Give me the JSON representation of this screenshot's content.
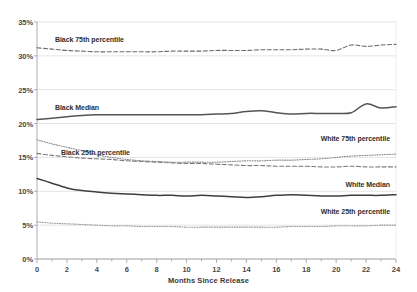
{
  "chart_data": {
    "type": "line",
    "title": "",
    "xlabel": "Months Since Release",
    "ylabel": "",
    "xlim": [
      0,
      24
    ],
    "ylim": [
      0,
      35
    ],
    "grid": true,
    "legend_position": "inline-labels",
    "x_tick_labels": [
      "0",
      "2",
      "4",
      "6",
      "8",
      "10",
      "12",
      "14",
      "16",
      "18",
      "20",
      "22",
      "24"
    ],
    "x_tick_values": [
      0,
      2,
      4,
      6,
      8,
      10,
      12,
      14,
      16,
      18,
      20,
      22,
      24
    ],
    "y_tick_labels": [
      "0%",
      "5%",
      "10%",
      "15%",
      "20%",
      "25%",
      "30%",
      "35%"
    ],
    "y_tick_values": [
      0,
      5,
      10,
      15,
      20,
      25,
      30,
      35
    ],
    "x": [
      0,
      1,
      2,
      3,
      4,
      5,
      6,
      7,
      8,
      9,
      10,
      11,
      12,
      13,
      14,
      15,
      16,
      17,
      18,
      19,
      20,
      21,
      22,
      23,
      24
    ],
    "series": [
      {
        "name": "Black 75th percentile",
        "style": "dashed",
        "color": "#6b6b6b",
        "label_anchor": "left",
        "label_x": 1.2,
        "label_y": 32.3,
        "values": [
          31.2,
          31.0,
          30.8,
          30.7,
          30.6,
          30.6,
          30.6,
          30.6,
          30.6,
          30.7,
          30.7,
          30.7,
          30.8,
          30.8,
          30.8,
          30.9,
          30.9,
          30.9,
          31.0,
          31.0,
          30.8,
          31.6,
          31.4,
          31.6,
          31.7
        ]
      },
      {
        "name": "Black Median",
        "style": "solid",
        "color": "#555555",
        "label_anchor": "left",
        "label_x": 1.2,
        "label_y": 22.3,
        "values": [
          20.6,
          20.8,
          21.0,
          21.2,
          21.3,
          21.3,
          21.3,
          21.3,
          21.3,
          21.3,
          21.3,
          21.3,
          21.4,
          21.5,
          21.8,
          21.9,
          21.6,
          21.4,
          21.5,
          21.5,
          21.5,
          21.6,
          22.9,
          22.3,
          22.5
        ]
      },
      {
        "name": "Black 25th percentile",
        "style": "dashed",
        "color": "#7a7a7a",
        "label_anchor": "left",
        "label_x": 1.6,
        "label_y": 15.6,
        "values": [
          15.6,
          15.3,
          15.1,
          14.9,
          14.8,
          14.7,
          14.5,
          14.4,
          14.3,
          14.2,
          14.1,
          14.1,
          14.0,
          13.9,
          13.8,
          13.8,
          13.7,
          13.7,
          13.7,
          13.6,
          13.6,
          13.7,
          13.6,
          13.6,
          13.6
        ]
      },
      {
        "name": "White 75th percentile",
        "style": "dotted",
        "color": "#8a8a8a",
        "label_anchor": "right",
        "label_x": 23.6,
        "label_y": 17.7,
        "values": [
          17.6,
          17.0,
          16.5,
          16.0,
          15.4,
          15.0,
          14.7,
          14.5,
          14.4,
          14.3,
          14.3,
          14.3,
          14.3,
          14.4,
          14.5,
          14.5,
          14.6,
          14.6,
          14.7,
          14.8,
          15.0,
          15.2,
          15.3,
          15.4,
          15.5
        ]
      },
      {
        "name": "White Median",
        "style": "solid",
        "color": "#3f3f3f",
        "label_anchor": "right",
        "label_x": 23.6,
        "label_y": 11.0,
        "values": [
          11.9,
          11.2,
          10.5,
          10.1,
          9.9,
          9.7,
          9.6,
          9.5,
          9.4,
          9.4,
          9.3,
          9.4,
          9.3,
          9.2,
          9.1,
          9.2,
          9.4,
          9.5,
          9.4,
          9.3,
          9.3,
          9.4,
          9.4,
          9.4,
          9.5
        ]
      },
      {
        "name": "White 25th percentile",
        "style": "dotted",
        "color": "#9a9a9a",
        "label_anchor": "right",
        "label_x": 23.6,
        "label_y": 7.0,
        "values": [
          5.5,
          5.3,
          5.2,
          5.1,
          5.0,
          4.9,
          4.9,
          4.8,
          4.8,
          4.8,
          4.7,
          4.7,
          4.7,
          4.7,
          4.7,
          4.7,
          4.7,
          4.8,
          4.8,
          4.8,
          4.9,
          4.9,
          4.9,
          5.0,
          5.0
        ]
      }
    ]
  }
}
